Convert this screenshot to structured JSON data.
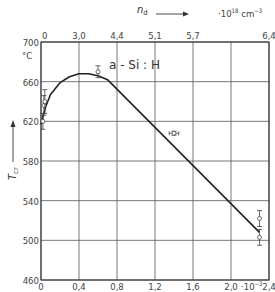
{
  "chart_data": {
    "type": "line",
    "annotation": "a - Si : H",
    "xlabel": "",
    "xlabel_unit_bottom": "·10⁻³",
    "x_top_label": "n_d",
    "x_top_unit": "·10¹⁸ cm⁻³",
    "ylabel": "T_cr",
    "ylabel_unit": "°C",
    "xlim": [
      0,
      2.4
    ],
    "ylim": [
      460,
      700
    ],
    "grid": true,
    "x_ticks": [
      "0",
      "0,4",
      "0,8",
      "1,2",
      "1,6",
      "2,0",
      "2,4"
    ],
    "x_tick_values": [
      0,
      0.4,
      0.8,
      1.2,
      1.6,
      2.0,
      2.4
    ],
    "x_top_ticks": [
      "0",
      "3,0",
      "4,4",
      "5,1",
      "5,7",
      "6,4"
    ],
    "x_top_tick_positions": [
      0,
      0.4,
      0.8,
      1.2,
      1.6,
      2.4
    ],
    "y_ticks": [
      "460",
      "500",
      "540",
      "580",
      "620",
      "660",
      "700"
    ],
    "y_tick_values": [
      460,
      500,
      540,
      580,
      620,
      660,
      700
    ],
    "series": [
      {
        "name": "fit curve",
        "x": [
          0.0,
          0.05,
          0.1,
          0.2,
          0.3,
          0.4,
          0.5,
          0.6,
          0.7,
          2.3
        ],
        "values": [
          617,
          635,
          647,
          659,
          665,
          668,
          668,
          666,
          662,
          508
        ]
      },
      {
        "name": "measured",
        "x": [
          0.02,
          0.03,
          0.04,
          0.6,
          1.4,
          2.3,
          2.3
        ],
        "values": [
          620,
          636,
          640,
          670,
          608,
          522,
          503
        ],
        "y_err": [
          8,
          10,
          12,
          6,
          2,
          8,
          8
        ],
        "x_err": [
          0,
          0,
          0,
          0,
          0.05,
          0,
          0
        ]
      }
    ]
  }
}
